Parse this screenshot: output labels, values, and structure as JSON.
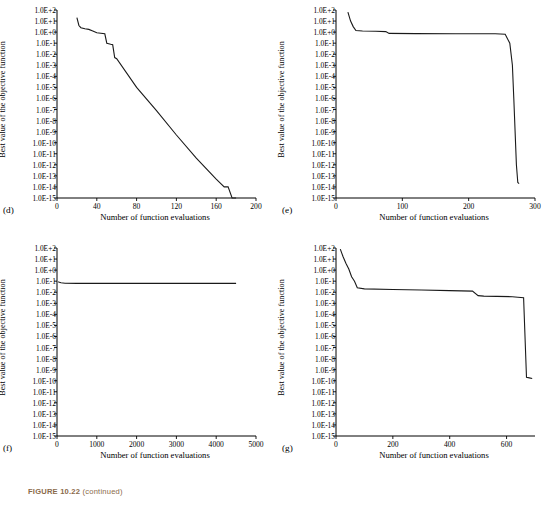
{
  "figure": {
    "caption_label": "FIGURE 10.22",
    "caption_text": "(continued)"
  },
  "panels": [
    {
      "letter": "(d)",
      "xlabel": "Number of function evaluations",
      "ylabel": "Best value of the objective function",
      "xticks": [
        "0",
        "40",
        "80",
        "120",
        "160",
        "200"
      ],
      "xtickvals": [
        0,
        40,
        80,
        120,
        160,
        200
      ],
      "xlim": [
        0,
        200
      ],
      "yticks": [
        "1.0E+2",
        "1.0E+1",
        "1.0E+0",
        "1.0E-1",
        "1.0E-2",
        "1.0E-3",
        "1.0E-4",
        "1.0E-5",
        "1.0E-6",
        "1.0E-7",
        "1.0E-8",
        "1.0E-9",
        "1.0E-10",
        "1.0E-11",
        "1.0E-12",
        "1.0E-13",
        "1.0E-14",
        "1.0E-15"
      ],
      "ylim": [
        -15,
        2
      ],
      "series_x": [
        20,
        22,
        24,
        28,
        32,
        36,
        40,
        44,
        48,
        50,
        52,
        54,
        56,
        58,
        60,
        80,
        100,
        120,
        140,
        160,
        168,
        172,
        176,
        180
      ],
      "series_y": [
        1.3,
        0.6,
        0.4,
        0.3,
        0.25,
        0.1,
        -0.05,
        -0.1,
        -0.15,
        -1.0,
        -1.05,
        -1.1,
        -1.15,
        -2.3,
        -2.4,
        -5.0,
        -7.1,
        -9.3,
        -11.4,
        -13.3,
        -14.0,
        -14.0,
        -15.0,
        -15.0
      ]
    },
    {
      "letter": "(e)",
      "xlabel": "Number of function evaluations",
      "ylabel": "Best value of the objective function",
      "xticks": [
        "0",
        "100",
        "200",
        "300"
      ],
      "xtickvals": [
        0,
        100,
        200,
        300
      ],
      "xlim": [
        0,
        300
      ],
      "yticks": [
        "1.0E+2",
        "1.0E+1",
        "1.0E+0",
        "1.0E-1",
        "1.0E-2",
        "1.0E-3",
        "1.0E-4",
        "1.0E-5",
        "1.0E-6",
        "1.0E-7",
        "1.0E-8",
        "1.0E-9",
        "1.0E-10",
        "1.0E-11",
        "1.0E-12",
        "1.0E-13",
        "1.0E-14",
        "1.0E-15"
      ],
      "ylim": [
        -15,
        2
      ],
      "series_x": [
        18,
        22,
        26,
        30,
        40,
        60,
        75,
        80,
        120,
        180,
        240,
        255,
        262,
        266,
        268,
        270,
        272,
        274,
        276
      ],
      "series_y": [
        1.8,
        1.0,
        0.5,
        0.15,
        0.1,
        0.08,
        0.05,
        -0.12,
        -0.13,
        -0.14,
        -0.15,
        -0.2,
        -1.0,
        -3.0,
        -6.0,
        -9.0,
        -12.0,
        -13.6,
        -13.7
      ]
    },
    {
      "letter": "(f)",
      "xlabel": "Number of function evaluations",
      "ylabel": "Best value of the objective function",
      "xticks": [
        "0",
        "1000",
        "2000",
        "3000",
        "4000",
        "5000"
      ],
      "xtickvals": [
        0,
        1000,
        2000,
        3000,
        4000,
        5000
      ],
      "xlim": [
        0,
        5000
      ],
      "yticks": [
        "1.0E+2",
        "1.0E+1",
        "1.0E+0",
        "1.0E-1",
        "1.0E-2",
        "1.0E-3",
        "1.0E-4",
        "1.0E-5",
        "1.0E-6",
        "1.0E-7",
        "1.0E-8",
        "1.0E-9",
        "1.0E-10",
        "1.0E-11",
        "1.0E-12",
        "1.0E-13",
        "1.0E-14",
        "1.0E-15"
      ],
      "ylim": [
        -15,
        2
      ],
      "series_x": [
        30,
        60,
        100,
        200,
        500,
        1000,
        2000,
        3000,
        4000,
        4500
      ],
      "series_y": [
        -1.05,
        -1.1,
        -1.15,
        -1.18,
        -1.2,
        -1.2,
        -1.2,
        -1.2,
        -1.2,
        -1.2
      ]
    },
    {
      "letter": "(g)",
      "xlabel": "Number of function evaluations",
      "ylabel": "Best value of the objective function",
      "xticks": [
        "0",
        "200",
        "400",
        "600"
      ],
      "xtickvals": [
        0,
        200,
        400,
        600
      ],
      "xlim": [
        0,
        700
      ],
      "yticks": [
        "1.0E+2",
        "1.0E+1",
        "1.0E+0",
        "1.0E-1",
        "1.0E-2",
        "1.0E-3",
        "1.0E-4",
        "1.0E-5",
        "1.0E-6",
        "1.0E-7",
        "1.0E-8",
        "1.0E-9",
        "1.0E-10",
        "1.0E-11",
        "1.0E-12",
        "1.0E-13",
        "1.0E-14",
        "1.0E-15"
      ],
      "ylim": [
        -15,
        2
      ],
      "series_x": [
        15,
        25,
        35,
        45,
        55,
        65,
        75,
        100,
        200,
        300,
        400,
        480,
        500,
        520,
        620,
        640,
        660,
        670,
        680,
        690
      ],
      "series_y": [
        1.9,
        1.2,
        0.6,
        0.1,
        -0.6,
        -1.0,
        -1.6,
        -1.7,
        -1.75,
        -1.8,
        -1.85,
        -1.9,
        -2.3,
        -2.35,
        -2.4,
        -2.45,
        -2.5,
        -9.7,
        -9.75,
        -9.8
      ]
    }
  ],
  "chart_data": {
    "type": "line",
    "title": "FIGURE 10.22 (continued)",
    "subplots": 4,
    "shared_xlabel": "Number of function evaluations",
    "shared_ylabel": "Best value of the objective function",
    "yaxis_scale": "log10",
    "yaxis_ticklabels": [
      "1.0E+2",
      "1.0E+1",
      "1.0E+0",
      "1.0E-1",
      "1.0E-2",
      "1.0E-3",
      "1.0E-4",
      "1.0E-5",
      "1.0E-6",
      "1.0E-7",
      "1.0E-8",
      "1.0E-9",
      "1.0E-10",
      "1.0E-11",
      "1.0E-12",
      "1.0E-13",
      "1.0E-14",
      "1.0E-15"
    ],
    "grid": false,
    "legend": "none",
    "series": [
      {
        "name": "(d)",
        "xlim": [
          0,
          200
        ],
        "xticks": [
          0,
          40,
          80,
          120,
          160,
          200
        ],
        "x": [
          20,
          22,
          24,
          28,
          32,
          36,
          40,
          44,
          48,
          50,
          52,
          54,
          56,
          58,
          60,
          80,
          100,
          120,
          140,
          160,
          168,
          172,
          176,
          180
        ],
        "y_log10": [
          1.3,
          0.6,
          0.4,
          0.3,
          0.25,
          0.1,
          -0.05,
          -0.1,
          -0.15,
          -1.0,
          -1.05,
          -1.1,
          -1.15,
          -2.3,
          -2.4,
          -5.0,
          -7.1,
          -9.3,
          -11.4,
          -13.3,
          -14.0,
          -14.0,
          -15.0,
          -15.0
        ]
      },
      {
        "name": "(e)",
        "xlim": [
          0,
          300
        ],
        "xticks": [
          0,
          100,
          200,
          300
        ],
        "x": [
          18,
          22,
          26,
          30,
          40,
          60,
          75,
          80,
          120,
          180,
          240,
          255,
          262,
          266,
          268,
          270,
          272,
          274,
          276
        ],
        "y_log10": [
          1.8,
          1.0,
          0.5,
          0.15,
          0.1,
          0.08,
          0.05,
          -0.12,
          -0.13,
          -0.14,
          -0.15,
          -0.2,
          -1.0,
          -3.0,
          -6.0,
          -9.0,
          -12.0,
          -13.6,
          -13.7
        ]
      },
      {
        "name": "(f)",
        "xlim": [
          0,
          5000
        ],
        "xticks": [
          0,
          1000,
          2000,
          3000,
          4000,
          5000
        ],
        "x": [
          30,
          60,
          100,
          200,
          500,
          1000,
          2000,
          3000,
          4000,
          4500
        ],
        "y_log10": [
          -1.05,
          -1.1,
          -1.15,
          -1.18,
          -1.2,
          -1.2,
          -1.2,
          -1.2,
          -1.2,
          -1.2
        ]
      },
      {
        "name": "(g)",
        "xlim": [
          0,
          700
        ],
        "xticks": [
          0,
          200,
          400,
          600
        ],
        "x": [
          15,
          25,
          35,
          45,
          55,
          65,
          75,
          100,
          200,
          300,
          400,
          480,
          500,
          520,
          620,
          640,
          660,
          670,
          680,
          690
        ],
        "y_log10": [
          1.9,
          1.2,
          0.6,
          0.1,
          -0.6,
          -1.0,
          -1.6,
          -1.7,
          -1.75,
          -1.8,
          -1.85,
          -1.9,
          -2.3,
          -2.35,
          -2.4,
          -2.45,
          -2.5,
          -9.7,
          -9.75,
          -9.8
        ]
      }
    ]
  }
}
